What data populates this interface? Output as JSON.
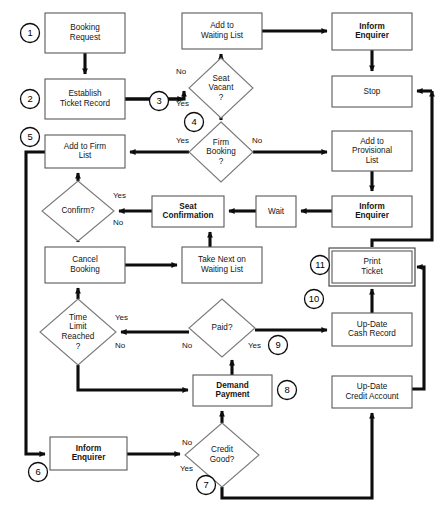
{
  "diagram": {
    "colors": {
      "background": "#ffffff",
      "box_stroke": "#5a5a5a",
      "diamond_stroke": "#7a7a7a",
      "arrow": "#0d0d0d",
      "text": "#151515",
      "step_circle": "#000000"
    },
    "nodes": [
      {
        "id": "booking_request",
        "type": "process",
        "label": [
          "Booking",
          "Request"
        ],
        "bold": false,
        "x": 45,
        "y": 13,
        "w": 80,
        "h": 40
      },
      {
        "id": "establish_ticket",
        "type": "process",
        "label": [
          "Establish",
          "Ticket Record"
        ],
        "bold": false,
        "x": 45,
        "y": 79,
        "w": 80,
        "h": 40
      },
      {
        "id": "add_waiting_list",
        "type": "process",
        "label": [
          "Add to",
          "Waiting List"
        ],
        "bold": false,
        "x": 182,
        "y": 13,
        "w": 80,
        "h": 36
      },
      {
        "id": "inform_enquirer_top",
        "type": "process",
        "label": [
          "Inform",
          "Enquirer"
        ],
        "bold": true,
        "x": 332,
        "y": 13,
        "w": 80,
        "h": 37
      },
      {
        "id": "stop",
        "type": "process",
        "label": [
          "Stop"
        ],
        "bold": false,
        "x": 332,
        "y": 76,
        "w": 80,
        "h": 31
      },
      {
        "id": "add_provisional_list",
        "type": "process",
        "label": [
          "Add to",
          "Provisional",
          "List"
        ],
        "bold": false,
        "x": 332,
        "y": 131,
        "w": 80,
        "h": 40
      },
      {
        "id": "inform_enquirer_mid",
        "type": "process",
        "label": [
          "Inform",
          "Enquirer"
        ],
        "bold": true,
        "x": 332,
        "y": 196,
        "w": 80,
        "h": 31
      },
      {
        "id": "add_firm_list",
        "type": "process",
        "label": [
          "Add to Firm",
          "List"
        ],
        "bold": false,
        "x": 45,
        "y": 135,
        "w": 80,
        "h": 33
      },
      {
        "id": "seat_confirmation",
        "type": "process",
        "label": [
          "Seat",
          "Confirmation"
        ],
        "bold": true,
        "x": 152,
        "y": 196,
        "w": 72,
        "h": 31
      },
      {
        "id": "wait",
        "type": "process",
        "label": [
          "Wait"
        ],
        "bold": false,
        "x": 256,
        "y": 196,
        "w": 40,
        "h": 31
      },
      {
        "id": "cancel_booking",
        "type": "process",
        "label": [
          "Cancel",
          "Booking"
        ],
        "bold": false,
        "x": 45,
        "y": 247,
        "w": 80,
        "h": 36
      },
      {
        "id": "take_next_waiting",
        "type": "process",
        "label": [
          "Take Next on",
          "Waiting List"
        ],
        "bold": false,
        "x": 182,
        "y": 247,
        "w": 80,
        "h": 36
      },
      {
        "id": "print_ticket",
        "type": "process-double",
        "label": [
          "Print",
          "Ticket"
        ],
        "bold": false,
        "x": 332,
        "y": 251,
        "w": 80,
        "h": 32
      },
      {
        "id": "update_cash_record",
        "type": "process",
        "label": [
          "Up-Date",
          "Cash Record"
        ],
        "bold": false,
        "x": 332,
        "y": 313,
        "w": 80,
        "h": 33
      },
      {
        "id": "demand_payment",
        "type": "process",
        "label": [
          "Demand",
          "Payment"
        ],
        "bold": true,
        "x": 193,
        "y": 375,
        "w": 79,
        "h": 31
      },
      {
        "id": "update_credit_account",
        "type": "process",
        "label": [
          "Up-Date",
          "Credit Account"
        ],
        "bold": false,
        "x": 332,
        "y": 376,
        "w": 80,
        "h": 32
      },
      {
        "id": "inform_enquirer_bottom",
        "type": "process",
        "label": [
          "Inform",
          "Enquirer"
        ],
        "bold": true,
        "x": 50,
        "y": 437,
        "w": 77,
        "h": 33
      }
    ],
    "decisions": [
      {
        "id": "seat_vacant",
        "label": [
          "Seat",
          "Vacant",
          "?"
        ],
        "cx": 221,
        "cy": 88,
        "rx": 32,
        "ry": 30
      },
      {
        "id": "firm_booking",
        "label": [
          "Firm",
          "Booking",
          "?"
        ],
        "cx": 221,
        "cy": 152,
        "rx": 32,
        "ry": 30
      },
      {
        "id": "confirm",
        "label": [
          "Confirm?"
        ],
        "cx": 78,
        "cy": 211,
        "rx": 36,
        "ry": 30
      },
      {
        "id": "time_limit",
        "label": [
          "Time",
          "Limit",
          "Reached",
          "?"
        ],
        "cx": 78,
        "cy": 332,
        "rx": 38,
        "ry": 33
      },
      {
        "id": "paid",
        "label": [
          "Paid?"
        ],
        "cx": 222,
        "cy": 328,
        "rx": 33,
        "ry": 29
      },
      {
        "id": "credit_good",
        "label": [
          "Credit",
          "Good?"
        ],
        "cx": 222,
        "cy": 455,
        "rx": 37,
        "ry": 32
      }
    ],
    "edge_labels": [
      {
        "id": "seat-vacant-no",
        "text": "No",
        "x": 176,
        "y": 74
      },
      {
        "id": "seat-vacant-yes",
        "text": "Yes",
        "x": 176,
        "y": 106
      },
      {
        "id": "firm-booking-yes",
        "text": "Yes",
        "x": 176,
        "y": 143
      },
      {
        "id": "firm-booking-no",
        "text": "No",
        "x": 252,
        "y": 143
      },
      {
        "id": "confirm-yes",
        "text": "Yes",
        "x": 113,
        "y": 198
      },
      {
        "id": "confirm-no",
        "text": "No",
        "x": 113,
        "y": 225
      },
      {
        "id": "time-limit-yes",
        "text": "Yes",
        "x": 115,
        "y": 320
      },
      {
        "id": "time-limit-no",
        "text": "No",
        "x": 115,
        "y": 348
      },
      {
        "id": "paid-no",
        "text": "No",
        "x": 182,
        "y": 348
      },
      {
        "id": "paid-yes",
        "text": "Yes",
        "x": 248,
        "y": 348
      },
      {
        "id": "credit-good-no",
        "text": "No",
        "x": 182,
        "y": 445
      },
      {
        "id": "credit-good-yes",
        "text": "Yes",
        "x": 180,
        "y": 471
      }
    ],
    "step_markers": [
      {
        "id": "step-1",
        "number": "1",
        "cx": 30,
        "cy": 33
      },
      {
        "id": "step-2",
        "number": "2",
        "cx": 30,
        "cy": 99
      },
      {
        "id": "step-3",
        "number": "3",
        "cx": 159,
        "cy": 101
      },
      {
        "id": "step-4",
        "number": "4",
        "cx": 194,
        "cy": 122
      },
      {
        "id": "step-5",
        "number": "5",
        "cx": 30,
        "cy": 137
      },
      {
        "id": "step-6",
        "number": "6",
        "cx": 38,
        "cy": 472
      },
      {
        "id": "step-7",
        "number": "7",
        "cx": 206,
        "cy": 485
      },
      {
        "id": "step-8",
        "number": "8",
        "cx": 287,
        "cy": 390
      },
      {
        "id": "step-9",
        "number": "9",
        "cx": 278,
        "cy": 345
      },
      {
        "id": "step-10",
        "number": "10",
        "cx": 314,
        "cy": 299
      },
      {
        "id": "step-11",
        "number": "11",
        "cx": 320,
        "cy": 265
      }
    ]
  }
}
